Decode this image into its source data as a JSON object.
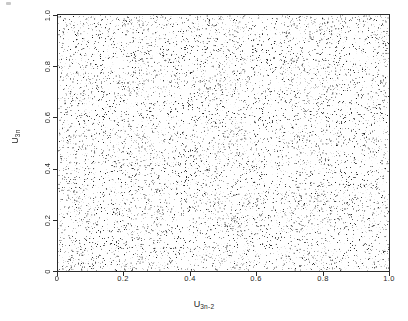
{
  "figure": {
    "background": "#ffffff",
    "ink_color": "#262626",
    "frame_color": "#2b2b2b"
  },
  "axes": {
    "x_title_base": "U",
    "x_title_sub": "3n-2",
    "y_title_base": "U",
    "y_title_sub": "3n"
  },
  "ticks": {
    "x": [
      "0",
      "0.2",
      "0.4",
      "0.6",
      "0.8",
      "1.0"
    ],
    "y": [
      "0",
      "0.2",
      "0.4",
      "0.6",
      "0.8",
      "1.0"
    ]
  },
  "chart_data": {
    "type": "scatter",
    "title": "",
    "subtitle": "",
    "xlabel": "U_3n-2",
    "ylabel": "U_3n",
    "xlim": [
      0,
      1
    ],
    "ylim": [
      0,
      1
    ],
    "xticks": [
      0,
      0.2,
      0.4,
      0.6,
      0.8,
      1.0
    ],
    "yticks": [
      0,
      0.2,
      0.4,
      0.6,
      0.8,
      1.0
    ],
    "xticklabels": [
      "0",
      "0.2",
      "0.4",
      "0.6",
      "0.8",
      "1.0"
    ],
    "yticklabels": [
      "0",
      "0.2",
      "0.4",
      "0.6",
      "0.8",
      "1.0"
    ],
    "grid": false,
    "legend": null,
    "legend_position": "none",
    "marker": "point",
    "marker_size_px": 1,
    "marker_color": "#111111",
    "n_points": 10000,
    "distribution": "uniform",
    "series": [
      {
        "name": "uniform random pairs",
        "x_range": [
          0,
          1
        ],
        "y_range": [
          0,
          1
        ],
        "count": 10000,
        "density_per_unit_area": 10000
      }
    ],
    "annotations": []
  }
}
